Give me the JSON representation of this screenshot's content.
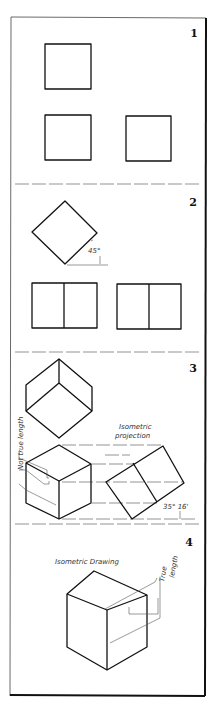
{
  "figure": {
    "panels": [
      {
        "number": "1",
        "description": "Three orthographic views of a cube: three equal squares"
      },
      {
        "number": "2",
        "description": "Cube rotated 45 degrees: top view diamond, front and side views as divided rectangles",
        "angle_label": "45°"
      },
      {
        "number": "3",
        "description": "Cube tilted forward: isometric projection with projection lines",
        "angle_label": "35° 16'",
        "labels": [
          "Not true length",
          "Isometric projection"
        ]
      },
      {
        "number": "4",
        "description": "Isometric drawing of cube with true-length edges",
        "labels": [
          "Isometric Drawing",
          "True length"
        ]
      }
    ],
    "colors": {
      "line": "#111111",
      "frame": "#222222",
      "background": "#ffffff"
    }
  }
}
